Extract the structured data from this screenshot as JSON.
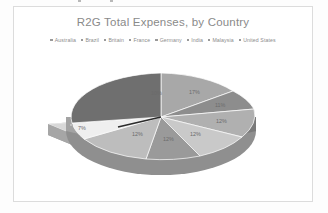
{
  "card": {
    "background": "#ffffff",
    "border_color": "#dcdcdc"
  },
  "chart_data": {
    "type": "pie",
    "title": "R2G Total Expenses, by Country",
    "subtitle": "",
    "xlabel": "",
    "ylabel": "",
    "legend_position": "top",
    "grid": false,
    "exploded_slice": "Australia",
    "style": "3d-exploded-pie",
    "categories": [
      "Australia",
      "Brazil",
      "Britain",
      "France",
      "Germany",
      "India",
      "Malaysia",
      "United States"
    ],
    "values": [
      7,
      12,
      12,
      12,
      12,
      12,
      17,
      11
    ],
    "labels": [
      "7%",
      "12%",
      "12%",
      "12%",
      "12%",
      "10%",
      "17%",
      "11%"
    ],
    "colors": [
      "#d3d3d3",
      "#b0b0b0",
      "#c9c9c9",
      "#9a9a9a",
      "#bdbdbd",
      "#6f6f6f",
      "#a8a8a8",
      "#8d8d8d"
    ],
    "slice_labels": [
      {
        "name": "slice-label-17",
        "text": "17%",
        "x": 175,
        "y": 38
      },
      {
        "name": "slice-label-11",
        "text": "11%",
        "x": 201,
        "y": 51
      },
      {
        "name": "slice-label-12-right",
        "text": "12%",
        "x": 202,
        "y": 67
      },
      {
        "name": "slice-label-12-lower-right",
        "text": "12%",
        "x": 176,
        "y": 80
      },
      {
        "name": "slice-label-12-bottom",
        "text": "12%",
        "x": 149,
        "y": 85
      },
      {
        "name": "slice-label-12-lower-left",
        "text": "12%",
        "x": 118,
        "y": 80
      },
      {
        "name": "slice-label-7-exploded",
        "text": "7%",
        "x": 64,
        "y": 74
      },
      {
        "name": "slice-label-10",
        "text": "10%",
        "x": 137,
        "y": 39
      }
    ]
  },
  "legend": {
    "marker_color": "#9a9a9a",
    "items": [
      {
        "label": "Australia",
        "color": "#d3d3d3"
      },
      {
        "label": "Brazil",
        "color": "#b0b0b0"
      },
      {
        "label": "Britain",
        "color": "#c9c9c9"
      },
      {
        "label": "France",
        "color": "#9a9a9a"
      },
      {
        "label": "Germany",
        "color": "#bdbdbd"
      },
      {
        "label": "India",
        "color": "#6f6f6f"
      },
      {
        "label": "Malaysia",
        "color": "#a8a8a8"
      },
      {
        "label": "United States",
        "color": "#8d8d8d"
      }
    ]
  }
}
